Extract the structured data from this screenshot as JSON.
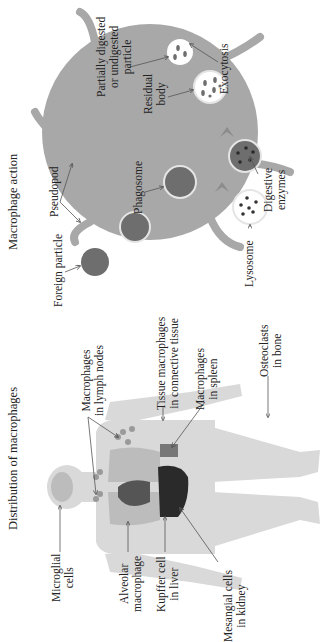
{
  "left_panel": {
    "title": "Distribution of macrophages",
    "labels": {
      "microglial": "Microglial\ncells",
      "lymph": "Macrophages\nin lymph nodes",
      "tissue": "Tissue macrophages\nin connective tissue",
      "spleen": "Macrophages\nin spleen",
      "osteoclasts": "Osteoclasts\nin bone",
      "alveolar": "Alveolar\nmacrophage",
      "kupffer": "Kupffer cell\nin liver",
      "mesangial": "Mesangial cells\nin kidney"
    }
  },
  "right_panel": {
    "title": "Macrophage action",
    "labels": {
      "foreign": "Foreign particle",
      "pseudopod": "Pseudopod",
      "partially": "Partially digested\nor undigested\nparticle",
      "phagosome": "Phagosome",
      "residual": "Residual\nbody",
      "exocytosis": "Exocytosis",
      "lysosome": "Lysosome",
      "enzymes": "Digestive\nenzymes"
    }
  },
  "colors": {
    "body": "#d9d9d9",
    "cell": "#a8a8a8",
    "particle": "#6e6e6e",
    "organ_dark": "#2a2a2a",
    "organ_mid": "#8c8c8c",
    "text": "#222222"
  }
}
